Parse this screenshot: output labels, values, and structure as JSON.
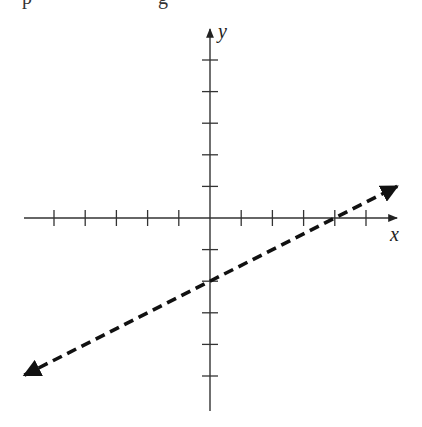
{
  "header_fragment": {
    "left_text": "p",
    "mid_text": "g"
  },
  "chart_data": {
    "type": "line",
    "title": "",
    "xlabel": "x",
    "ylabel": "y",
    "xlim": [
      -6,
      6
    ],
    "ylim": [
      -6,
      6
    ],
    "x_ticks": [
      -5,
      -4,
      -3,
      -2,
      -1,
      1,
      2,
      3,
      4,
      5
    ],
    "y_ticks": [
      -5,
      -4,
      -3,
      -2,
      -1,
      1,
      2,
      3,
      4,
      5
    ],
    "tick_labels_shown": false,
    "grid": false,
    "series": [
      {
        "name": "line",
        "style": "dashed",
        "arrows": "both",
        "equation": "y = 0.5x - 2",
        "slope": 0.5,
        "y_intercept": -2,
        "x_intercept": 4,
        "x": [
          -6,
          -4,
          -2,
          0,
          2,
          4,
          6
        ],
        "values": [
          -5,
          -4,
          -3,
          -2,
          -1,
          0,
          1
        ]
      }
    ],
    "colors": {
      "axis": "#333333",
      "line": "#111111"
    }
  }
}
